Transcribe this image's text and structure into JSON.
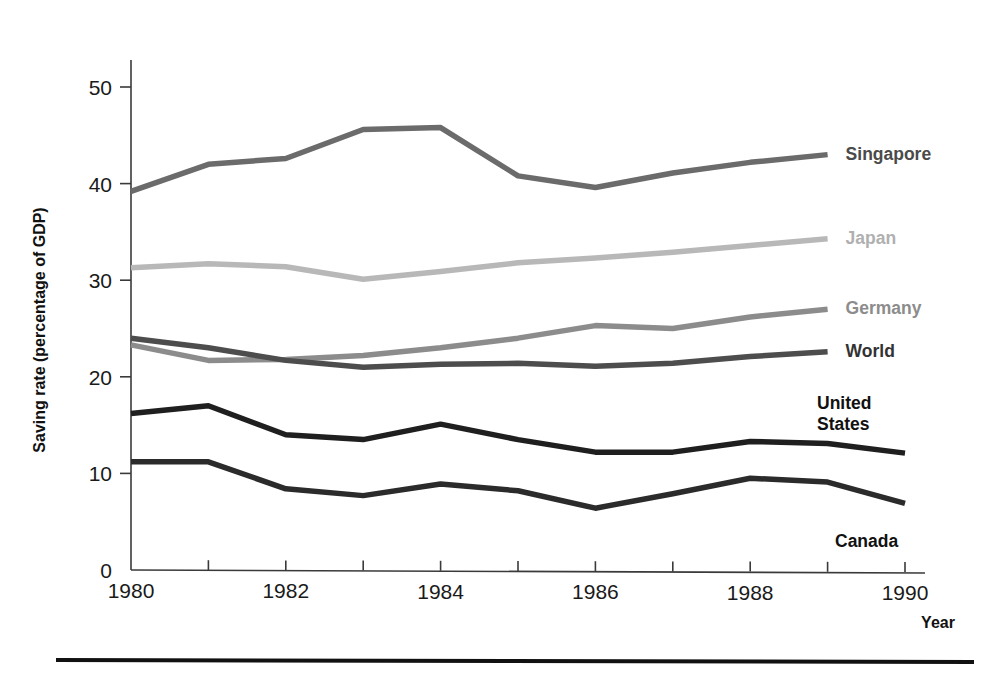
{
  "figure": {
    "background": "#ffffff",
    "rule_color": "#111111"
  },
  "chart_data": {
    "type": "line",
    "title": "",
    "subtitle": "",
    "xlabel": "Year",
    "ylabel": "Saving rate (percentage of GDP)",
    "x": [
      1980,
      1981,
      1982,
      1983,
      1984,
      1985,
      1986,
      1987,
      1988,
      1989,
      1990
    ],
    "xlim": [
      1980,
      1990
    ],
    "ylim": [
      0,
      52
    ],
    "grid": false,
    "legend_position": "right-inline-labels",
    "xticks": [
      1980,
      1981,
      1982,
      1983,
      1984,
      1985,
      1986,
      1987,
      1988,
      1989,
      1990
    ],
    "xtick_labels": [
      "1980",
      "",
      "1982",
      "",
      "1984",
      "",
      "1986",
      "",
      "1988",
      "",
      "1990"
    ],
    "yticks": [
      0,
      10,
      20,
      30,
      40,
      50
    ],
    "ytick_labels": [
      "0",
      "10",
      "20",
      "30",
      "40",
      "50"
    ],
    "series": [
      {
        "name": "Singapore",
        "color": "#6b6b6b",
        "width": 5.5,
        "label_color": "#4a4a4a",
        "x": [
          1980,
          1981,
          1982,
          1983,
          1984,
          1985,
          1986,
          1987,
          1988,
          1989
        ],
        "values": [
          39.2,
          42.0,
          42.6,
          45.6,
          45.8,
          40.8,
          39.6,
          41.1,
          42.2,
          43.0
        ]
      },
      {
        "name": "Japan",
        "color": "#b8b8b8",
        "width": 5.5,
        "label_color": "#b0b0b0",
        "x": [
          1980,
          1981,
          1982,
          1983,
          1984,
          1985,
          1986,
          1987,
          1988,
          1989
        ],
        "values": [
          31.3,
          31.7,
          31.4,
          30.1,
          30.9,
          31.8,
          32.3,
          32.9,
          33.6,
          34.3
        ]
      },
      {
        "name": "Germany",
        "color": "#8c8c8c",
        "width": 5.5,
        "label_color": "#8c8c8c",
        "x": [
          1980,
          1981,
          1982,
          1983,
          1984,
          1985,
          1986,
          1987,
          1988,
          1989
        ],
        "values": [
          23.3,
          21.7,
          21.8,
          22.2,
          23.0,
          24.0,
          25.3,
          25.0,
          26.2,
          27.0
        ]
      },
      {
        "name": "World",
        "color": "#4d4d4d",
        "width": 5.5,
        "label_color": "#333333",
        "x": [
          1980,
          1981,
          1982,
          1983,
          1984,
          1985,
          1986,
          1987,
          1988,
          1989
        ],
        "values": [
          24.0,
          23.0,
          21.7,
          21.0,
          21.3,
          21.4,
          21.1,
          21.4,
          22.1,
          22.6
        ]
      },
      {
        "name": "United States",
        "color": "#1f1f1f",
        "width": 5.5,
        "label_color": "#111111",
        "x": [
          1980,
          1981,
          1982,
          1983,
          1984,
          1985,
          1986,
          1987,
          1988,
          1989,
          1990
        ],
        "values": [
          16.2,
          17.0,
          14.0,
          13.5,
          15.1,
          13.5,
          12.2,
          12.2,
          13.3,
          13.1,
          12.1
        ]
      },
      {
        "name": "Canada",
        "color": "#2b2b2b",
        "width": 5.5,
        "label_color": "#111111",
        "x": [
          1980,
          1981,
          1982,
          1983,
          1984,
          1985,
          1986,
          1987,
          1988,
          1989,
          1990
        ],
        "values": [
          11.2,
          11.2,
          8.4,
          7.7,
          8.9,
          8.2,
          6.4,
          7.9,
          9.5,
          9.1,
          6.9
        ]
      }
    ],
    "series_labels": [
      {
        "name": "Singapore",
        "text": "Singapore",
        "lines": [
          "Singapore"
        ]
      },
      {
        "name": "Japan",
        "text": "Japan",
        "lines": [
          "Japan"
        ]
      },
      {
        "name": "Germany",
        "text": "Germany",
        "lines": [
          "Germany"
        ]
      },
      {
        "name": "World",
        "text": "World",
        "lines": [
          "World"
        ]
      },
      {
        "name": "United States",
        "text": "United States",
        "lines": [
          "United",
          "States"
        ]
      },
      {
        "name": "Canada",
        "text": "Canada",
        "lines": [
          "Canada"
        ]
      }
    ]
  }
}
